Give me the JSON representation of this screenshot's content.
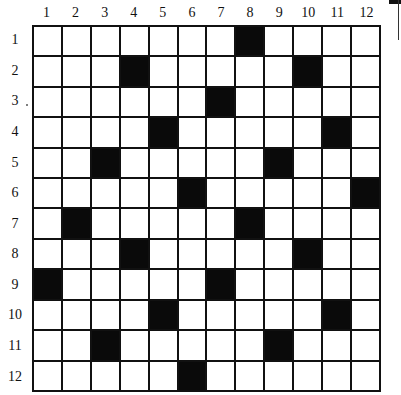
{
  "puzzle": {
    "rows": 12,
    "cols": 12,
    "column_labels": [
      "1",
      "2",
      "3",
      "4",
      "5",
      "6",
      "7",
      "8",
      "9",
      "10",
      "11",
      "12"
    ],
    "row_labels": [
      "1",
      "2",
      "3",
      "4",
      "5",
      "6",
      "7",
      "8",
      "9",
      "10",
      "11",
      "12"
    ],
    "black_cells": [
      [
        1,
        8
      ],
      [
        2,
        4
      ],
      [
        2,
        10
      ],
      [
        3,
        7
      ],
      [
        4,
        5
      ],
      [
        4,
        11
      ],
      [
        5,
        3
      ],
      [
        5,
        9
      ],
      [
        6,
        6
      ],
      [
        6,
        12
      ],
      [
        7,
        2
      ],
      [
        7,
        8
      ],
      [
        8,
        4
      ],
      [
        8,
        10
      ],
      [
        9,
        1
      ],
      [
        9,
        7
      ],
      [
        10,
        5
      ],
      [
        10,
        11
      ],
      [
        11,
        3
      ],
      [
        11,
        9
      ],
      [
        12,
        6
      ]
    ],
    "colors": {
      "grid_line": "#111111",
      "black_cell": "#0a0a0a",
      "white_cell": "#ffffff"
    }
  }
}
